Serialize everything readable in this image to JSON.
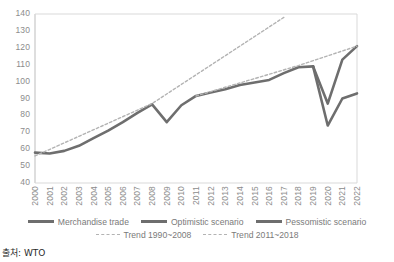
{
  "source_note": "출처: WTO",
  "legend": {
    "items": [
      {
        "label": "Merchandise trade",
        "style": "solid",
        "color": "#6e6e6e"
      },
      {
        "label": "Optimistic scenario",
        "style": "solid",
        "color": "#6e6e6e"
      },
      {
        "label": "Pessomistic scenario",
        "style": "solid",
        "color": "#6e6e6e"
      },
      {
        "label": "Trend 1990~2008",
        "style": "dashed",
        "color": "#b3b3b3"
      },
      {
        "label": "Trend 2011~2018",
        "style": "dashed",
        "color": "#b3b3b3"
      }
    ]
  },
  "chart_data": {
    "type": "line",
    "title": "",
    "xlabel": "",
    "ylabel": "",
    "ylim": [
      40,
      140
    ],
    "ytick_step": 10,
    "yticks": [
      40,
      50,
      60,
      70,
      80,
      90,
      100,
      110,
      120,
      130,
      140
    ],
    "grid": false,
    "legend_position": "bottom",
    "x": [
      2000,
      2001,
      2002,
      2003,
      2004,
      2005,
      2006,
      2007,
      2008,
      2009,
      2010,
      2011,
      2012,
      2013,
      2014,
      2015,
      2016,
      2017,
      2018,
      2019,
      2020,
      2021,
      2022
    ],
    "xtick_labels": [
      "2000",
      "2001",
      "2002",
      "2003",
      "2004",
      "2005",
      "2006",
      "2007",
      "2008",
      "2009",
      "2010",
      "2011",
      "2012",
      "2013",
      "2014",
      "2015",
      "2016",
      "2017",
      "2018",
      "2019",
      "2020",
      "2021",
      "2022"
    ],
    "series": [
      {
        "name": "Merchandise trade",
        "style": "solid",
        "color": "#6e6e6e",
        "width": 2.6,
        "x": [
          2000,
          2001,
          2002,
          2003,
          2004,
          2005,
          2006,
          2007,
          2008,
          2009,
          2010,
          2011,
          2012,
          2013,
          2014,
          2015,
          2016,
          2017,
          2018,
          2019
        ],
        "values": [
          58,
          57.5,
          59,
          62,
          66.5,
          71,
          76,
          81.5,
          86.5,
          76,
          86,
          91.5,
          93.5,
          95.5,
          98,
          99.5,
          101,
          105,
          108.5,
          109
        ]
      },
      {
        "name": "Optimistic scenario",
        "style": "solid",
        "color": "#6e6e6e",
        "width": 2.6,
        "x": [
          2019,
          2020,
          2021,
          2022
        ],
        "values": [
          109,
          87,
          113,
          121
        ]
      },
      {
        "name": "Pessomistic scenario",
        "style": "solid",
        "color": "#6e6e6e",
        "width": 2.6,
        "x": [
          2019,
          2020,
          2021,
          2022
        ],
        "values": [
          109,
          74,
          90,
          93
        ]
      },
      {
        "name": "Trend 1990~2008",
        "style": "dashed",
        "color": "#b3b3b3",
        "width": 1.4,
        "x": [
          2000,
          2008,
          2017
        ],
        "values": [
          56,
          87,
          138
        ]
      },
      {
        "name": "Trend 2011~2018",
        "style": "dashed",
        "color": "#b3b3b3",
        "width": 1.4,
        "x": [
          2011,
          2018,
          2022
        ],
        "values": [
          91.5,
          109.5,
          121
        ]
      }
    ]
  }
}
